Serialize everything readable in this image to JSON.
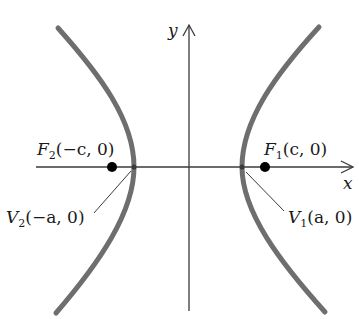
{
  "diagram": {
    "type": "hyperbola-foci-vertices",
    "colors": {
      "curve": "#6e6e6e",
      "axis": "#3a3a3a",
      "text": "#1a1a1a",
      "point": "#000000",
      "background": "#ffffff"
    },
    "axes": {
      "x_label": "x",
      "y_label": "y"
    },
    "points": {
      "F1": {
        "letter": "F",
        "sub": "1",
        "coords": "(c, 0)"
      },
      "F2": {
        "letter": "F",
        "sub": "2",
        "coords": "(−c, 0)"
      },
      "V1": {
        "letter": "V",
        "sub": "1",
        "coords": "(a, 0)"
      },
      "V2": {
        "letter": "V",
        "sub": "2",
        "coords": "(−a, 0)"
      }
    }
  }
}
